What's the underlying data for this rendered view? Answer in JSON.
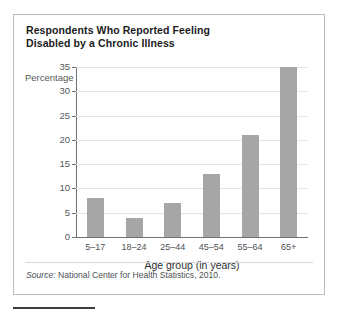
{
  "figure": {
    "title_line1": "Respondents Who Reported Feeling",
    "title_line2": "Disabled by a Chronic Illness",
    "source_prefix": "Source:",
    "source_text": "National Center for Health Statistics, 2010."
  },
  "chart_data": {
    "type": "bar",
    "title": "Respondents Who Reported Feeling Disabled by a Chronic Illness",
    "categories": [
      "5–17",
      "18–24",
      "25–44",
      "45–54",
      "55–64",
      "65+"
    ],
    "values": [
      8,
      4,
      7,
      13,
      21,
      35
    ],
    "xlabel": "Age group (in years)",
    "ylabel": "Percentage",
    "ylim": [
      0,
      35
    ],
    "yticks": [
      0,
      5,
      10,
      15,
      20,
      25,
      30,
      35
    ],
    "grid": true,
    "legend": null,
    "bar_color": "#a6a6a6",
    "grid_color": "#e2e3e5",
    "axis_color": "#6e7176"
  }
}
